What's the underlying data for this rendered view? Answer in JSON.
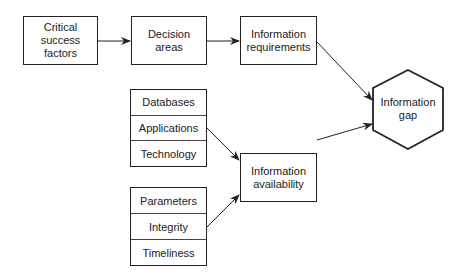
{
  "nodes": {
    "critical_success_factors": "Critical\nsuccess\nfactors",
    "decision_areas": "Decision\nareas",
    "information_requirements": "Information\nrequirements",
    "information_availability": "Information\navailability",
    "information_gap": "Information\ngap"
  },
  "stack_systems": [
    "Databases",
    "Applications",
    "Technology"
  ],
  "stack_quality": [
    "Parameters",
    "Integrity",
    "Timeliness"
  ],
  "edges": [
    {
      "from": "Critical success factors",
      "to": "Decision areas"
    },
    {
      "from": "Decision areas",
      "to": "Information requirements"
    },
    {
      "from": "Information requirements",
      "to": "Information gap"
    },
    {
      "from": "Applications",
      "to": "Information availability"
    },
    {
      "from": "Integrity",
      "to": "Information availability"
    },
    {
      "from": "Information availability",
      "to": "Information gap"
    }
  ],
  "colors": {
    "stroke": "#222222",
    "background": "#ffffff"
  }
}
